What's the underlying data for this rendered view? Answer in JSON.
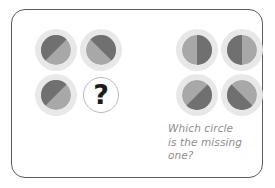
{
  "card": {
    "name": "missing-circle-puzzle",
    "border_color": "#5b5b5b",
    "background_color": "#ffffff"
  },
  "palette": {
    "halo": "#e8e8e8",
    "light_gray": "#a8a8a8",
    "dark_gray": "#707070",
    "ring_outline": "#b9b9b9",
    "question_mark_color": "#1c1c1c",
    "prompt_text_color": "#8e8e8e"
  },
  "left_group": {
    "label": "left-circle-group",
    "cells": [
      {
        "id": "left-top-left",
        "position": "top-left",
        "split": "diagonal",
        "split_angle_deg": 45,
        "dark_side": "upper-left",
        "x": 23,
        "y": 19
      },
      {
        "id": "left-top-right",
        "position": "top-right",
        "split": "diagonal",
        "split_angle_deg": 45,
        "dark_side": "upper-right",
        "x": 68,
        "y": 19
      },
      {
        "id": "left-bottom-left",
        "position": "bottom-left",
        "split": "diagonal",
        "split_angle_deg": 45,
        "dark_side": "upper-left",
        "x": 23,
        "y": 64
      }
    ],
    "missing_cell": {
      "id": "left-bottom-right",
      "position": "bottom-right",
      "glyph": "?",
      "x": 68,
      "y": 64
    }
  },
  "right_group": {
    "label": "right-circle-group",
    "cells": [
      {
        "id": "right-top-left",
        "position": "top-left",
        "split": "vertical",
        "dark_side": "right",
        "x": 164,
        "y": 19
      },
      {
        "id": "right-top-right",
        "position": "top-right",
        "split": "vertical",
        "dark_side": "left",
        "x": 209,
        "y": 19
      },
      {
        "id": "right-bottom-left",
        "position": "bottom-left",
        "split": "diagonal",
        "split_angle_deg": 45,
        "dark_side": "lower-right",
        "x": 164,
        "y": 64
      },
      {
        "id": "right-bottom-right",
        "position": "bottom-right",
        "split": "diagonal",
        "split_angle_deg": 45,
        "dark_side": "lower-left",
        "x": 209,
        "y": 64
      }
    ]
  },
  "prompt": {
    "line1": "Which circle",
    "line2": "is the missing",
    "line3": "one?",
    "full_text": "Which circle is the missing one?"
  }
}
